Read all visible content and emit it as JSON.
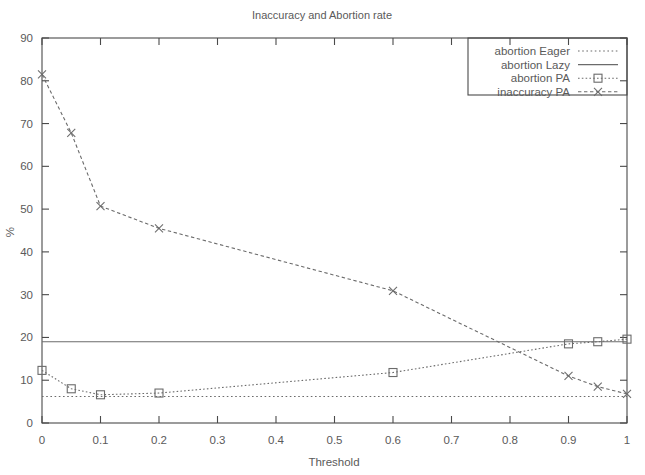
{
  "chart_data": {
    "type": "line",
    "title": "Inaccuracy and Abortion rate",
    "xlabel": "Threshold",
    "ylabel": "%",
    "xlim": [
      0,
      1
    ],
    "ylim": [
      0,
      90
    ],
    "grid": false,
    "legend_position": "top-right",
    "xticks": [
      "0",
      "0.1",
      "0.2",
      "0.3",
      "0.4",
      "0.5",
      "0.6",
      "0.7",
      "0.8",
      "0.9",
      "1"
    ],
    "xtick_values": [
      0,
      0.1,
      0.2,
      0.3,
      0.4,
      0.5,
      0.6,
      0.7,
      0.8,
      0.9,
      1
    ],
    "yticks": [
      "0",
      "10",
      "20",
      "30",
      "40",
      "50",
      "60",
      "70",
      "80",
      "90"
    ],
    "ytick_values": [
      0,
      10,
      20,
      30,
      40,
      50,
      60,
      70,
      80,
      90
    ],
    "series": [
      {
        "name": "abortion Eager",
        "style": "dotted",
        "marker": "none",
        "color": "#6b6b6b",
        "x": [
          0,
          1
        ],
        "values": [
          6.2,
          6.2
        ]
      },
      {
        "name": "abortion Lazy",
        "style": "solid",
        "marker": "none",
        "color": "#6b6b6b",
        "x": [
          0,
          1
        ],
        "values": [
          19.0,
          19.0
        ]
      },
      {
        "name": "abortion PA",
        "style": "dashed",
        "marker": "square",
        "color": "#6b6b6b",
        "x": [
          0,
          0.05,
          0.1,
          0.2,
          0.6,
          0.9,
          0.95,
          1
        ],
        "values": [
          12.3,
          8.0,
          6.6,
          7.0,
          11.8,
          18.5,
          19.0,
          19.6
        ]
      },
      {
        "name": "inaccuracy PA",
        "style": "dashed",
        "marker": "cross",
        "color": "#6b6b6b",
        "x": [
          0,
          0.05,
          0.1,
          0.2,
          0.6,
          0.9,
          0.95,
          1
        ],
        "values": [
          81.5,
          67.8,
          50.7,
          45.5,
          30.9,
          11.0,
          8.5,
          6.8
        ]
      }
    ]
  }
}
